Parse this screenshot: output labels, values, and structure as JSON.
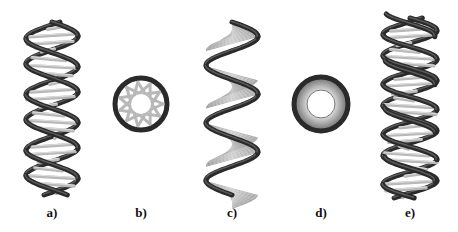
{
  "figure": {
    "panels": [
      {
        "id": "a",
        "label": "a)",
        "kind": "double-helix-ladder",
        "description": "helix with rungs, side view"
      },
      {
        "id": "b",
        "label": "b)",
        "kind": "ring-star",
        "description": "top view of helix with rungs"
      },
      {
        "id": "c",
        "label": "c)",
        "kind": "ribbon-helix",
        "description": "helix with surface, side view"
      },
      {
        "id": "d",
        "label": "d)",
        "kind": "ring-solid",
        "description": "top view of ribbon helix"
      },
      {
        "id": "e",
        "label": "e)",
        "kind": "double-helix-ladder",
        "description": "double helix with rungs, side view"
      }
    ],
    "colors": {
      "strand": "#2a2a2a",
      "rung": "#b8b8b8",
      "ribbon": "#a8a8a8",
      "background": "#ffffff"
    }
  }
}
